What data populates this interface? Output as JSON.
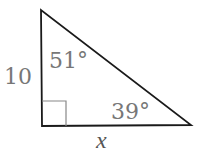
{
  "diagram": {
    "type": "right-triangle",
    "vertical_side_label": "10",
    "top_angle_label": "51°",
    "right_angle_label": "39°",
    "bottom_side_label": "x",
    "colors": {
      "stroke": "#1a1a1a",
      "right_angle_marker": "#888888",
      "text": "#777777"
    }
  }
}
